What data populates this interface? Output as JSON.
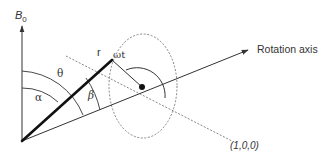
{
  "diagram": {
    "type": "geometry-vector-diagram",
    "labels": {
      "b0_main": "B",
      "b0_sub": "0",
      "rotation_axis": "Rotation axis",
      "r": "r",
      "theta": "θ",
      "alpha": "α",
      "beta": "β",
      "omega_t": "ωt",
      "direction": "(1,0,0)"
    },
    "elements": [
      {
        "id": "b0-axis",
        "kind": "arrow",
        "style": "solid",
        "label": "B0"
      },
      {
        "id": "rotation-axis",
        "kind": "arrow",
        "style": "solid",
        "label": "Rotation axis"
      },
      {
        "id": "r-vector",
        "kind": "line",
        "style": "thick",
        "label": "r"
      },
      {
        "id": "x-direction",
        "kind": "line",
        "style": "dashed",
        "label": "(1,0,0)"
      },
      {
        "id": "rotation-circle",
        "kind": "ellipse",
        "style": "dashed"
      },
      {
        "id": "axis-point",
        "kind": "dot"
      },
      {
        "id": "theta-angle",
        "kind": "arc",
        "between": [
          "B0",
          "r"
        ],
        "label": "θ"
      },
      {
        "id": "alpha-angle",
        "kind": "arc",
        "between": [
          "B0",
          "r"
        ],
        "label": "α"
      },
      {
        "id": "beta-angle",
        "kind": "arc",
        "between": [
          "r",
          "Rotation axis"
        ],
        "label": "β"
      },
      {
        "id": "omega-t-angle",
        "kind": "arc",
        "between": [
          "radius",
          "(1,0,0)"
        ],
        "label": "ωt"
      }
    ],
    "colors": {
      "ink": "#333333",
      "thick_line": "#111111",
      "dashed": "#777777"
    }
  }
}
